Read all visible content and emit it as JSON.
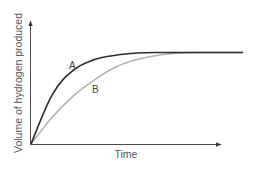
{
  "chart_data": {
    "type": "line",
    "title": "",
    "xlabel": "Time",
    "ylabel": "Volume of hydrogen produced",
    "grid": false,
    "legend": "inline labels on curves",
    "axis_ticks": false,
    "x_range": [
      0,
      10
    ],
    "y_range": [
      0,
      10
    ],
    "series": [
      {
        "name": "A",
        "color": "#2b2b2b",
        "description": "Faster initial rate, reaches plateau earlier",
        "x": [
          0,
          1,
          2,
          3,
          4,
          5,
          6,
          7,
          8,
          9,
          10
        ],
        "y": [
          0,
          4.6,
          6.9,
          7.9,
          8.3,
          8.5,
          8.55,
          8.55,
          8.55,
          8.55,
          8.55
        ]
      },
      {
        "name": "B",
        "color": "#b3b3b3",
        "description": "Slower initial rate, reaches the same final volume later",
        "x": [
          0,
          1,
          2,
          3,
          4,
          5,
          6,
          7,
          8,
          9,
          10
        ],
        "y": [
          0,
          2.5,
          4.5,
          6.0,
          7.2,
          7.9,
          8.3,
          8.5,
          8.55,
          8.55,
          8.55
        ]
      }
    ]
  },
  "labels": {
    "x_axis": "Time",
    "y_axis": "Volume of hydrogen produced",
    "curve_a": "A",
    "curve_b": "B"
  },
  "colors": {
    "curve_a": "#2b2b2b",
    "curve_b": "#b3b3b3",
    "axis": "#4a4a4a",
    "text": "#555555"
  }
}
